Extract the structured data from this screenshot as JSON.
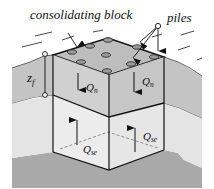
{
  "diagram": {
    "labels": {
      "consolidating_block": "consolidating block",
      "piles": "piles",
      "zf_main": "z",
      "zf_sub": "f",
      "qn_left_main": "Q",
      "qn_left_sub": "n",
      "qn_right_main": "Q",
      "qn_right_sub": "n",
      "qse_left_main": "Q",
      "qse_left_sub": "se",
      "qse_right_main": "Q",
      "qse_right_sub": "se"
    },
    "colors": {
      "ground_upper": "#c4c4c4",
      "ground_lower": "#e4e4e4",
      "bedrock": "#a9a9a9",
      "block_top": "#bdbdbd",
      "block_upper_left": "#d0d0d0",
      "block_upper_right": "#c6c6c6",
      "block_lower_left": "#ececec",
      "block_lower_right": "#e6e6e6",
      "pile_head": "#9a9a9a",
      "line": "#111111"
    }
  }
}
